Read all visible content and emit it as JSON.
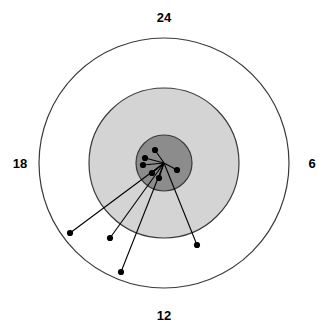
{
  "chart_data": {
    "type": "scatter",
    "title": "",
    "subtitle": "",
    "xlabel": "",
    "ylabel": "",
    "coordinate_system": "polar",
    "grid": false,
    "legend": null,
    "axis_labels": [
      {
        "name": "top-label",
        "text": "24",
        "position": "top",
        "angle_deg": 90
      },
      {
        "name": "right-label",
        "text": "6",
        "position": "right",
        "angle_deg": 0
      },
      {
        "name": "bottom-label",
        "text": "12",
        "position": "bottom",
        "angle_deg": 270
      },
      {
        "name": "left-label",
        "text": "18",
        "position": "left",
        "angle_deg": 180
      }
    ],
    "tick_labels": [
      "24",
      "6",
      "12",
      "18"
    ],
    "rings": [
      {
        "name": "outer-ring",
        "radius_px": 125,
        "radius_units": 24,
        "fill": "#ffffff",
        "stroke": "#3a3a3a"
      },
      {
        "name": "middle-ring",
        "radius_px": 75,
        "radius_units": 14.4,
        "fill": "#d4d4d4",
        "stroke": "#3a3a3a"
      },
      {
        "name": "inner-ring",
        "radius_px": 28,
        "radius_units": 5.4,
        "fill": "#8c8c8c",
        "stroke": "#3a3a3a"
      }
    ],
    "center": {
      "x": 164,
      "y": 163
    },
    "points": [
      {
        "id": 1,
        "x": 155,
        "y": 150,
        "r_px": 15.8,
        "r_units": 3.0,
        "theta_deg": 55
      },
      {
        "id": 2,
        "x": 145,
        "y": 158,
        "r_px": 19.6,
        "r_units": 3.8,
        "theta_deg": 165
      },
      {
        "id": 3,
        "x": 143,
        "y": 165,
        "r_px": 21.1,
        "r_units": 4.1,
        "theta_deg": 185
      },
      {
        "id": 4,
        "x": 177,
        "y": 170,
        "r_px": 14.8,
        "r_units": 2.8,
        "theta_deg": 332
      },
      {
        "id": 5,
        "x": 152,
        "y": 173,
        "r_px": 15.6,
        "r_units": 3.0,
        "theta_deg": 220
      },
      {
        "id": 6,
        "x": 159,
        "y": 178,
        "r_px": 15.8,
        "r_units": 3.0,
        "theta_deg": 252
      },
      {
        "id": 7,
        "x": 70,
        "y": 233,
        "r_px": 117,
        "r_units": 22.5,
        "theta_deg": 217
      },
      {
        "id": 8,
        "x": 110,
        "y": 238,
        "r_px": 92,
        "r_units": 17.7,
        "theta_deg": 234
      },
      {
        "id": 9,
        "x": 121,
        "y": 272,
        "r_px": 117,
        "r_units": 22.5,
        "theta_deg": 249
      },
      {
        "id": 10,
        "x": 197,
        "y": 245,
        "r_px": 88,
        "r_units": 16.9,
        "theta_deg": 292
      }
    ],
    "colors": {
      "outer_fill": "#ffffff",
      "middle_fill": "#d4d4d4",
      "inner_fill": "#8c8c8c",
      "ring_stroke": "#3a3a3a",
      "point": "#000000",
      "line": "#000000",
      "label": "#000000",
      "background": "#ffffff"
    }
  }
}
